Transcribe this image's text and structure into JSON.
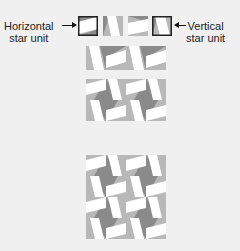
{
  "labels": {
    "horizontal": [
      "Horizontal",
      "star unit"
    ],
    "vertical": [
      "Vertical",
      "star unit"
    ]
  },
  "colors": {
    "background": "#f0f0f0",
    "light_gray": "#b8b8b8",
    "dark_gray": "#8a8a8a",
    "white": "#ffffff",
    "outline": "#222222"
  },
  "diagram": {
    "top_row_units": [
      "horizontal-outlined",
      "vertical",
      "horizontal",
      "vertical-outlined"
    ],
    "row2": {
      "rows": 1,
      "cols": 4
    },
    "block3": {
      "rows": 2,
      "cols": 4
    },
    "block4": {
      "rows": 4,
      "cols": 4
    }
  }
}
